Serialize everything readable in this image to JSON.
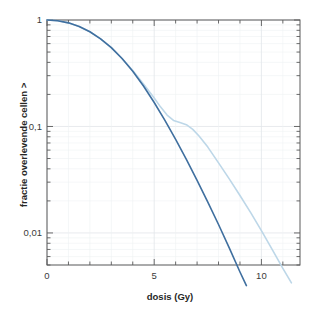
{
  "chart_data": {
    "type": "line",
    "title": "",
    "xlabel": "dosis (Gy)",
    "ylabel": "fractie overlevende cellen >",
    "xlim": [
      0,
      11.8
    ],
    "ylim": [
      0.005,
      1
    ],
    "yscale": "log",
    "xscale": "linear",
    "grid": true,
    "legend": "none",
    "x_ticks": [
      {
        "value": 0,
        "label": "0"
      },
      {
        "value": 5,
        "label": "5"
      },
      {
        "value": 10,
        "label": "10"
      }
    ],
    "x_minor_ticks": [
      1,
      2,
      3,
      4,
      6,
      7,
      8,
      9,
      11
    ],
    "y_ticks": [
      {
        "value": 1,
        "label": "1"
      },
      {
        "value": 0.1,
        "label": "0,1"
      },
      {
        "value": 0.01,
        "label": "0,01"
      }
    ],
    "series": [
      {
        "name": "dark-curve",
        "color": "#3f6f9f",
        "width": 1.6,
        "points": [
          {
            "x": 0.0,
            "y": 1.0
          },
          {
            "x": 0.5,
            "y": 0.985
          },
          {
            "x": 1.0,
            "y": 0.94
          },
          {
            "x": 1.5,
            "y": 0.87
          },
          {
            "x": 2.0,
            "y": 0.775
          },
          {
            "x": 2.5,
            "y": 0.665
          },
          {
            "x": 3.0,
            "y": 0.55
          },
          {
            "x": 3.5,
            "y": 0.435
          },
          {
            "x": 4.0,
            "y": 0.33
          },
          {
            "x": 4.5,
            "y": 0.24
          },
          {
            "x": 5.0,
            "y": 0.168
          },
          {
            "x": 5.5,
            "y": 0.114
          },
          {
            "x": 6.0,
            "y": 0.0755
          },
          {
            "x": 6.5,
            "y": 0.049
          },
          {
            "x": 7.0,
            "y": 0.0312
          },
          {
            "x": 7.5,
            "y": 0.0195
          },
          {
            "x": 8.0,
            "y": 0.012
          },
          {
            "x": 8.5,
            "y": 0.00725
          },
          {
            "x": 9.0,
            "y": 0.0043
          },
          {
            "x": 9.3,
            "y": 0.0032
          }
        ]
      },
      {
        "name": "light-curve",
        "color": "#bdd7e8",
        "width": 1.6,
        "points": [
          {
            "x": 0.0,
            "y": 1.0
          },
          {
            "x": 0.5,
            "y": 0.985
          },
          {
            "x": 1.0,
            "y": 0.94
          },
          {
            "x": 1.5,
            "y": 0.87
          },
          {
            "x": 2.0,
            "y": 0.775
          },
          {
            "x": 2.5,
            "y": 0.665
          },
          {
            "x": 3.0,
            "y": 0.55
          },
          {
            "x": 3.5,
            "y": 0.435
          },
          {
            "x": 4.0,
            "y": 0.335
          },
          {
            "x": 4.5,
            "y": 0.25
          },
          {
            "x": 5.0,
            "y": 0.185
          },
          {
            "x": 5.3,
            "y": 0.152
          },
          {
            "x": 5.6,
            "y": 0.128
          },
          {
            "x": 5.9,
            "y": 0.114
          },
          {
            "x": 6.2,
            "y": 0.109
          },
          {
            "x": 6.5,
            "y": 0.104
          },
          {
            "x": 6.8,
            "y": 0.094
          },
          {
            "x": 7.1,
            "y": 0.081
          },
          {
            "x": 7.5,
            "y": 0.064
          },
          {
            "x": 8.0,
            "y": 0.0455
          },
          {
            "x": 8.5,
            "y": 0.0322
          },
          {
            "x": 9.0,
            "y": 0.0225
          },
          {
            "x": 9.5,
            "y": 0.0155
          },
          {
            "x": 10.0,
            "y": 0.0105
          },
          {
            "x": 10.5,
            "y": 0.007
          },
          {
            "x": 11.0,
            "y": 0.00465
          },
          {
            "x": 11.4,
            "y": 0.0034
          }
        ]
      }
    ],
    "colors": {
      "axis": "#5a5a5a",
      "grid_major": "#e2e6ea",
      "grid_minor": "#eef1f4",
      "background": "#ffffff",
      "text": "#3b3b3b"
    }
  }
}
